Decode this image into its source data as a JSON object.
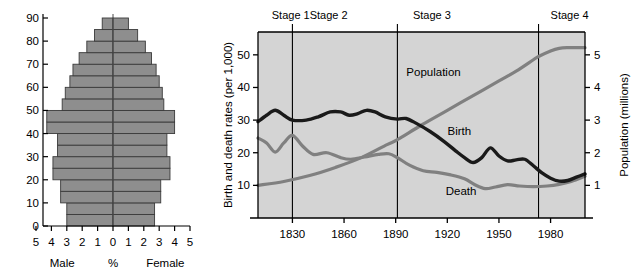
{
  "figures": {
    "pyramid": {
      "title": "",
      "x_axis": {
        "center_label": "%",
        "left_label": "Male",
        "right_label": "Female",
        "ticks_left": [
          "5",
          "4",
          "3",
          "2",
          "1"
        ],
        "tick_center": "0",
        "ticks_right": [
          "1",
          "2",
          "3",
          "4",
          "5"
        ],
        "min": -5,
        "max": 5
      },
      "y_axis": {
        "ticks": [
          "0",
          "10",
          "20",
          "30",
          "40",
          "50",
          "60",
          "70",
          "80",
          "90"
        ],
        "min": 0,
        "max": 90
      }
    },
    "dtm": {
      "stages": [
        {
          "label": "Stage 1",
          "start_year": 1810,
          "end_year": 1830
        },
        {
          "label": "Stage 2",
          "start_year": 1830,
          "end_year": 1891
        },
        {
          "label": "Stage 3",
          "start_year": 1891,
          "end_year": 1973
        },
        {
          "label": "Stage 4",
          "start_year": 1973,
          "end_year": 2000
        }
      ],
      "left_axis_title": "Birth and death rates (per 1,000)",
      "right_axis_title": "Population (millions)",
      "left_ticks": [
        "10",
        "20",
        "30",
        "40",
        "50"
      ],
      "right_ticks": [
        "1",
        "2",
        "3",
        "4",
        "5"
      ],
      "x_ticks": [
        "1830",
        "1860",
        "1890",
        "1920",
        "1950",
        "1980"
      ],
      "series_labels": {
        "population": "Population",
        "birth": "Birth",
        "death": "Death"
      },
      "colors": {
        "plot_background": "#d4d4d4",
        "birth_line": "#1a1a1a",
        "death_line": "#808080",
        "population_line": "#808080",
        "axis": "#000000",
        "divider": "#000000"
      }
    }
  },
  "chart_data": [
    {
      "type": "bar",
      "subtype": "population-pyramid",
      "title": "",
      "xlabel": "%",
      "ylabel": "Age",
      "xlim": [
        -5,
        5
      ],
      "ylim": [
        0,
        90
      ],
      "grid": false,
      "legend": [
        "Male",
        "Female"
      ],
      "legend_position": "below-axis",
      "xtick_labels": [
        "5",
        "4",
        "3",
        "2",
        "1",
        "0",
        "1",
        "2",
        "3",
        "4",
        "5"
      ],
      "ytick_labels": [
        "0",
        "10",
        "20",
        "30",
        "40",
        "50",
        "60",
        "70",
        "80",
        "90"
      ],
      "categories": [
        "0-4",
        "5-9",
        "10-14",
        "15-19",
        "20-24",
        "25-29",
        "30-34",
        "35-39",
        "40-44",
        "45-49",
        "50-54",
        "55-59",
        "60-64",
        "65-69",
        "70-74",
        "75-79",
        "80-84",
        "85-89"
      ],
      "series": [
        {
          "name": "Male",
          "units": "percent of total population",
          "values": [
            3.0,
            3.0,
            3.4,
            3.4,
            3.9,
            3.9,
            3.6,
            3.6,
            4.3,
            4.3,
            3.3,
            3.1,
            2.8,
            2.6,
            2.2,
            1.7,
            1.2,
            0.7
          ]
        },
        {
          "name": "Female",
          "units": "percent of total population",
          "values": [
            2.7,
            2.7,
            3.1,
            3.1,
            3.7,
            3.7,
            3.5,
            3.5,
            4.0,
            4.0,
            3.3,
            3.2,
            3.0,
            2.8,
            2.5,
            2.1,
            1.6,
            1.0
          ]
        }
      ]
    },
    {
      "type": "line",
      "subtype": "demographic-transition-model",
      "title": "",
      "xlabel": "",
      "ylabel": "Birth and death rates (per 1,000)",
      "y2label": "Population (millions)",
      "xlim": [
        1810,
        2000
      ],
      "ylim": [
        0,
        57
      ],
      "y2lim": [
        0,
        5.7
      ],
      "grid": false,
      "legend": [
        "Population",
        "Birth",
        "Death"
      ],
      "legend_position": "inline-annotations",
      "xtick_values": [
        1830,
        1860,
        1890,
        1920,
        1950,
        1980
      ],
      "xtick_labels": [
        "1830",
        "1860",
        "1890",
        "1920",
        "1950",
        "1980"
      ],
      "ytick_values": [
        10,
        20,
        30,
        40,
        50
      ],
      "ytick_labels": [
        "10",
        "20",
        "30",
        "40",
        "50"
      ],
      "y2tick_values": [
        1,
        2,
        3,
        4,
        5
      ],
      "y2tick_labels": [
        "1",
        "2",
        "3",
        "4",
        "5"
      ],
      "annotations": [
        {
          "text": "Stage 1",
          "x": 1818
        },
        {
          "text": "Stage 2",
          "x": 1840
        },
        {
          "text": "Stage 3",
          "x": 1900
        },
        {
          "text": "Stage 4",
          "x": 1980
        }
      ],
      "stage_boundaries": [
        1830,
        1891,
        1973
      ],
      "series": [
        {
          "name": "Birth",
          "axis": "left",
          "units": "per 1,000",
          "x": [
            1810,
            1815,
            1820,
            1825,
            1830,
            1838,
            1845,
            1852,
            1858,
            1863,
            1868,
            1873,
            1878,
            1884,
            1891,
            1896,
            1902,
            1910,
            1918,
            1925,
            1930,
            1935,
            1940,
            1945,
            1950,
            1955,
            1960,
            1965,
            1970,
            1975,
            1980,
            1985,
            1990,
            1995,
            2000
          ],
          "y": [
            29.5,
            31.5,
            33.0,
            31.5,
            30.0,
            30.0,
            31.0,
            32.5,
            32.5,
            31.5,
            32.0,
            33.0,
            32.5,
            31.0,
            30.3,
            30.5,
            29.0,
            26.5,
            23.5,
            20.5,
            18.5,
            17.0,
            18.5,
            21.5,
            19.0,
            17.5,
            17.8,
            18.0,
            16.0,
            13.8,
            12.2,
            11.3,
            11.5,
            12.5,
            13.5
          ]
        },
        {
          "name": "Death",
          "axis": "left",
          "units": "per 1,000",
          "x": [
            1810,
            1815,
            1820,
            1825,
            1830,
            1836,
            1842,
            1850,
            1858,
            1864,
            1872,
            1880,
            1886,
            1891,
            1898,
            1906,
            1914,
            1922,
            1930,
            1936,
            1942,
            1948,
            1955,
            1962,
            1970,
            1978,
            1985,
            1992,
            2000
          ],
          "y": [
            24.5,
            23.0,
            20.2,
            23.0,
            25.3,
            22.0,
            19.5,
            20.0,
            18.5,
            18.0,
            18.7,
            19.5,
            19.7,
            18.5,
            16.2,
            14.5,
            14.0,
            13.2,
            12.0,
            10.2,
            9.0,
            9.5,
            10.2,
            9.8,
            9.6,
            9.8,
            10.3,
            11.2,
            12.8
          ]
        },
        {
          "name": "Population",
          "axis": "right",
          "units": "millions",
          "x": [
            1810,
            1825,
            1840,
            1855,
            1870,
            1885,
            1891,
            1905,
            1920,
            1935,
            1950,
            1960,
            1970,
            1973,
            1980,
            1985,
            1990,
            2000
          ],
          "y": [
            1.0,
            1.12,
            1.3,
            1.55,
            1.85,
            2.25,
            2.4,
            2.85,
            3.3,
            3.75,
            4.2,
            4.5,
            4.85,
            4.95,
            5.12,
            5.2,
            5.22,
            5.22
          ]
        }
      ]
    }
  ]
}
